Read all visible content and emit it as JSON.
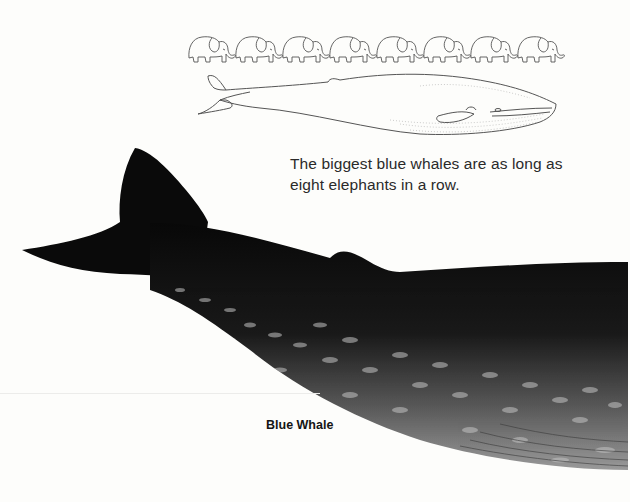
{
  "page": {
    "caption": "The biggest blue whales are as long as eight elephants in a row.",
    "label": "Blue Whale"
  },
  "illustrations": {
    "elephants": {
      "icon": "elephant-icon",
      "count": 8,
      "style": "line-drawing"
    },
    "outline_whale": {
      "icon": "whale-outline-icon",
      "style": "line-drawing"
    },
    "photo_whale": {
      "icon": "blue-whale-tail-icon",
      "style": "painted",
      "color": "#0b0b0b",
      "spot_color": "#bfbfbf"
    }
  },
  "colors": {
    "background": "#fdfdfb",
    "text": "#2a2a2a",
    "label_text": "#151515"
  }
}
